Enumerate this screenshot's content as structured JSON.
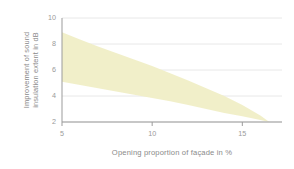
{
  "chart_data": {
    "type": "area",
    "title": "",
    "subtitle": "",
    "xlabel": "Opening proportion of façade in %",
    "ylabel": "Improvement of sound insulation extent in dB",
    "ylabel_line1": "Improvement of sound",
    "ylabel_line2": "insulation extent in dB",
    "xlim": [
      5,
      17.2
    ],
    "ylim": [
      2,
      10
    ],
    "xticks": [
      5,
      10,
      15
    ],
    "xtick_labels": [
      "5",
      "10",
      "15"
    ],
    "yticks": [
      2,
      4,
      6,
      8,
      10
    ],
    "ytick_labels": [
      "2",
      "4",
      "6",
      "8",
      "10"
    ],
    "grid": true,
    "grid_axis": "y",
    "legend": false,
    "legend_position": "none",
    "band_color": "#f0eec6",
    "grid_color": "#e8e8e8",
    "axis_color": "#9b9b9b",
    "tick_text_color": "#9a9a9a",
    "label_text_color": "#8a8a8a",
    "background": "#ffffff",
    "series": [
      {
        "name": "Improvement range",
        "kind": "band",
        "x": [
          5,
          6,
          7,
          8,
          9,
          10,
          11,
          12,
          13,
          14,
          15,
          16,
          16.5
        ],
        "upper": [
          8.9,
          8.35,
          7.8,
          7.3,
          6.8,
          6.3,
          5.75,
          5.2,
          4.6,
          4.0,
          3.3,
          2.5,
          2.0
        ],
        "lower": [
          5.1,
          4.85,
          4.6,
          4.35,
          4.1,
          3.85,
          3.6,
          3.3,
          3.0,
          2.7,
          2.45,
          2.15,
          2.0
        ]
      }
    ]
  },
  "figure": {
    "plot_left": 62,
    "plot_right": 282,
    "plot_top": 18,
    "plot_bottom": 122
  }
}
